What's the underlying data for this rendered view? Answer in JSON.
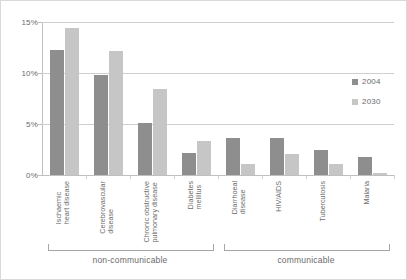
{
  "chart_data": {
    "type": "bar",
    "title": "",
    "subtitle": "",
    "xlabel": "",
    "ylabel": "",
    "ylim": [
      0,
      15
    ],
    "ytick_labels": [
      "0%",
      "5%",
      "10%",
      "15%"
    ],
    "ytick_values": [
      0,
      5,
      10,
      15
    ],
    "grid": true,
    "legend_position": "right",
    "categories": [
      "Ischaemic\nheart disease",
      "Cerebrovascular\ndisease",
      "Chronic obstructive\npulmonary disease",
      "Diabetes\nmellitus",
      "Diarrhoeal\ndisease",
      "HIV/AIDS",
      "Tuberculosis",
      "Malaria"
    ],
    "series": [
      {
        "name": "2004",
        "color": "#8e8e8e",
        "values": [
          12.3,
          9.8,
          5.1,
          2.2,
          3.6,
          3.6,
          2.5,
          1.8
        ]
      },
      {
        "name": "2030",
        "color": "#c6c6c6",
        "values": [
          14.4,
          12.2,
          8.4,
          3.3,
          1.1,
          2.1,
          1.1,
          0.2
        ]
      }
    ],
    "group_brackets": [
      {
        "label": "non-communicable",
        "from_category": 0,
        "to_category": 3
      },
      {
        "label": "communicable",
        "from_category": 4,
        "to_category": 7
      }
    ]
  },
  "legend": {
    "items": [
      {
        "label": "2004",
        "color": "#8e8e8e"
      },
      {
        "label": "2030",
        "color": "#c6c6c6"
      }
    ]
  },
  "colors": {
    "series_2004": "#8e8e8e",
    "series_2030": "#c6c6c6",
    "gridline": "#cfcfcf",
    "axis": "#bfbfbf",
    "text": "#6b6b6b",
    "frame": "#d9d9d9",
    "background": "#ffffff"
  }
}
